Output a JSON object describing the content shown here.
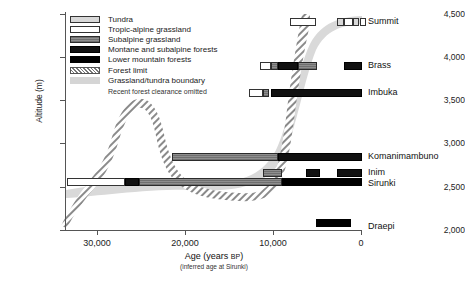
{
  "chart_data": {
    "type": "bar",
    "title": "",
    "xlabel": "Age (years BP)",
    "xlabel_sub": "(inferred age at Sirunki)",
    "ylabel": "Altitude (m)",
    "xlim": [
      33500,
      -1500
    ],
    "ylim": [
      1800,
      4650
    ],
    "xticks": [
      30000,
      20000,
      10000,
      0
    ],
    "xtick_labels": [
      "30,000",
      "20,000",
      "10,000",
      "0"
    ],
    "yticks": [
      2000,
      2500,
      3000,
      3500,
      4000,
      4500
    ],
    "ytick_labels": [
      "2,000",
      "2,500",
      "3,000",
      "3,500",
      "4,000",
      "4,500"
    ],
    "grid": false,
    "legend_position": "top-left",
    "axis_direction": "x-reversed",
    "sites": [
      {
        "name": "Summit",
        "altitude": 4450,
        "segments": [
          {
            "type": "tropic-alpine grassland",
            "start_bp": 11700,
            "end_bp": 9200
          },
          {
            "type": "tundra",
            "start_bp": 4100,
            "end_bp": 3400
          },
          {
            "type": "tropic-alpine grassland",
            "start_bp": 3300,
            "end_bp": 2300
          },
          {
            "type": "tundra",
            "start_bp": 2200,
            "end_bp": 1500
          },
          {
            "type": "tropic-alpine grassland",
            "start_bp": 1000,
            "end_bp": 300
          }
        ]
      },
      {
        "name": "Brass",
        "altitude": 3940,
        "segments": [
          {
            "type": "tropic-alpine grassland",
            "start_bp": 11500,
            "end_bp": 10400
          },
          {
            "type": "subalpine grassland",
            "start_bp": 10400,
            "end_bp": 9600
          },
          {
            "type": "montane and subalpine forests",
            "start_bp": 9600,
            "end_bp": 7300
          },
          {
            "type": "subalpine grassland",
            "start_bp": 7300,
            "end_bp": 5200
          },
          {
            "type": "montane and subalpine forests",
            "start_bp": 2000,
            "end_bp": 100
          }
        ]
      },
      {
        "name": "Imbuka",
        "altitude": 3630,
        "segments": [
          {
            "type": "tropic-alpine grassland",
            "start_bp": 12800,
            "end_bp": 11200
          },
          {
            "type": "subalpine grassland",
            "start_bp": 11200,
            "end_bp": 10600
          },
          {
            "type": "montane and subalpine forests",
            "start_bp": 10400,
            "end_bp": 100
          }
        ]
      },
      {
        "name": "Komanimambuno",
        "altitude": 2740,
        "segments": [
          {
            "type": "subalpine grassland",
            "start_bp": 21500,
            "end_bp": 9000
          },
          {
            "type": "montane and subalpine forests",
            "start_bp": 9000,
            "end_bp": 100
          }
        ]
      },
      {
        "name": "Inim",
        "altitude": 2550,
        "segments": [
          {
            "type": "subalpine grassland",
            "start_bp": 11100,
            "end_bp": 9000
          },
          {
            "type": "montane and subalpine forests",
            "start_bp": 6300,
            "end_bp": 4700
          },
          {
            "type": "montane and subalpine forests",
            "start_bp": 2800,
            "end_bp": 100
          }
        ]
      },
      {
        "name": "Sirunki",
        "altitude": 2480,
        "segments": [
          {
            "type": "tropic-alpine grassland",
            "start_bp": 33000,
            "end_bp": 26500
          },
          {
            "type": "montane and subalpine forests",
            "start_bp": 26500,
            "end_bp": 25000
          },
          {
            "type": "subalpine grassland",
            "start_bp": 25000,
            "end_bp": 8900
          },
          {
            "type": "lower mountain forests",
            "start_bp": 8900,
            "end_bp": 100
          }
        ]
      },
      {
        "name": "Draepi",
        "altitude": 1950,
        "segments": [
          {
            "type": "lower mountain forests",
            "start_bp": 5200,
            "end_bp": 1200
          }
        ]
      }
    ],
    "forest_limit_curve": {
      "name": "Forest limit",
      "points_bp_altitude": [
        [
          33200,
          1870
        ],
        [
          32000,
          2120
        ],
        [
          30500,
          2380
        ],
        [
          29200,
          2560
        ],
        [
          28200,
          2900
        ],
        [
          27400,
          3260
        ],
        [
          26800,
          3320
        ],
        [
          26000,
          3120
        ],
        [
          25000,
          2760
        ],
        [
          23500,
          2520
        ],
        [
          21000,
          2420
        ],
        [
          18000,
          2360
        ],
        [
          15000,
          2350
        ],
        [
          13000,
          2420
        ],
        [
          11800,
          2600
        ],
        [
          11000,
          2980
        ],
        [
          10600,
          3420
        ],
        [
          10300,
          3900
        ],
        [
          10100,
          4300
        ],
        [
          10000,
          4560
        ]
      ]
    },
    "grassland_tundra_curve": {
      "name": "Grassland/tundra boundary",
      "points_bp_altitude": [
        [
          33200,
          2420
        ],
        [
          30000,
          2560
        ],
        [
          27000,
          2620
        ],
        [
          23000,
          2600
        ],
        [
          18000,
          2560
        ],
        [
          14000,
          2600
        ],
        [
          12200,
          2760
        ],
        [
          11200,
          3150
        ],
        [
          10600,
          3640
        ],
        [
          10200,
          4080
        ],
        [
          9600,
          4420
        ],
        [
          8600,
          4540
        ],
        [
          7000,
          4560
        ],
        [
          5000,
          4540
        ],
        [
          3000,
          4520
        ],
        [
          1000,
          4500
        ]
      ]
    }
  },
  "legend": {
    "items": [
      {
        "label": "Tundra",
        "swatch": "tundra"
      },
      {
        "label": "Tropic-alpine grassland",
        "swatch": "tropic-alpine-grassland"
      },
      {
        "label": "Subalpine grassland",
        "swatch": "subalpine-grassland"
      },
      {
        "label": "Montane and subalpine forests",
        "swatch": "montane-subalpine-forests"
      },
      {
        "label": "Lower mountain forests",
        "swatch": "lower-mountain-forests"
      },
      {
        "label": "Forest limit",
        "swatch": "forest-limit"
      },
      {
        "label": "Grassland/tundra boundary",
        "swatch": "grassland-tundra-boundary"
      }
    ],
    "note": "Recent forest clearance omitted"
  },
  "colors": {
    "tundra": "#d8d8d8",
    "tropic_alpine_grassland": "#ffffff",
    "subalpine_grassland": "#7e7e7e",
    "montane_subalpine_forests": "#111111",
    "lower_mountain_forests": "#000000",
    "forest_limit_hatch": "#777777",
    "grassland_tundra_band": "#d5d5d5",
    "axis": "#555555",
    "text": "#1a1a1a"
  }
}
